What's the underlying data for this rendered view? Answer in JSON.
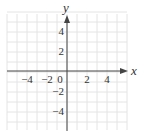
{
  "chart_data": {
    "type": "scatter",
    "title": "",
    "xlabel": "x",
    "ylabel": "y",
    "xlim": [
      -6,
      6
    ],
    "ylim": [
      -6,
      6
    ],
    "grid": true,
    "grid_step": 1,
    "x_ticks": [
      -4,
      -2,
      0,
      2,
      4
    ],
    "y_ticks": [
      4,
      2,
      -2,
      -4
    ],
    "x_tick_labels": [
      "−4",
      "−2",
      "0",
      "2",
      "4"
    ],
    "y_tick_labels": [
      "4",
      "2",
      "−2",
      "−4"
    ],
    "series": [],
    "legend": null
  },
  "colors": {
    "grid": "#e4e4e4",
    "axis": "#444444",
    "text": "#333333"
  }
}
